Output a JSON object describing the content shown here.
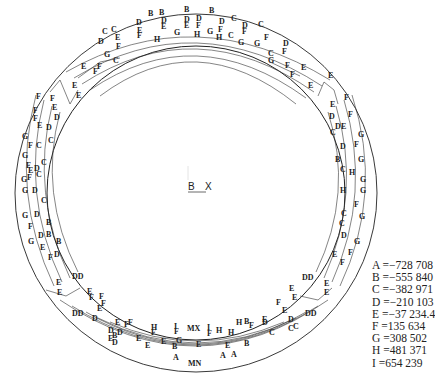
{
  "diagram": {
    "type": "contour-ring",
    "axis": {
      "x_label": "X",
      "origin_label": "B"
    },
    "legend": [
      {
        "key": "A",
        "value": "=−728 708"
      },
      {
        "key": "B",
        "value": "=−555 840"
      },
      {
        "key": "C",
        "value": "=−382 971"
      },
      {
        "key": "D",
        "value": "=−210 103"
      },
      {
        "key": "E",
        "value": "=−37 234.4"
      },
      {
        "key": "F",
        "value": "=135 634"
      },
      {
        "key": "G",
        "value": "=308 502"
      },
      {
        "key": "H",
        "value": "=481 371"
      },
      {
        "key": "I",
        "value": "=654 239"
      }
    ],
    "contour_labels": [
      {
        "t": "B",
        "x": 148,
        "y": 16
      },
      {
        "t": "B",
        "x": 159,
        "y": 15
      },
      {
        "t": "B",
        "x": 184,
        "y": 12
      },
      {
        "t": "B",
        "x": 209,
        "y": 13
      },
      {
        "t": "C",
        "x": 102,
        "y": 34
      },
      {
        "t": "C",
        "x": 111,
        "y": 32
      },
      {
        "t": "D",
        "x": 136,
        "y": 25
      },
      {
        "t": "D",
        "x": 161,
        "y": 23
      },
      {
        "t": "D",
        "x": 184,
        "y": 22
      },
      {
        "t": "D",
        "x": 196,
        "y": 21
      },
      {
        "t": "D",
        "x": 219,
        "y": 24
      },
      {
        "t": "C",
        "x": 231,
        "y": 21
      },
      {
        "t": "C",
        "x": 258,
        "y": 27
      },
      {
        "t": "D",
        "x": 242,
        "y": 28
      },
      {
        "t": "E",
        "x": 137,
        "y": 33
      },
      {
        "t": "E",
        "x": 161,
        "y": 29
      },
      {
        "t": "E",
        "x": 184,
        "y": 28
      },
      {
        "t": "F",
        "x": 196,
        "y": 28
      },
      {
        "t": "F",
        "x": 218,
        "y": 32
      },
      {
        "t": "F",
        "x": 242,
        "y": 34
      },
      {
        "t": "E",
        "x": 115,
        "y": 40
      },
      {
        "t": "F",
        "x": 137,
        "y": 38
      },
      {
        "t": "H",
        "x": 154,
        "y": 42
      },
      {
        "t": "G",
        "x": 174,
        "y": 35
      },
      {
        "t": "H",
        "x": 194,
        "y": 37
      },
      {
        "t": "G",
        "x": 207,
        "y": 34
      },
      {
        "t": "H",
        "x": 216,
        "y": 40
      },
      {
        "t": "C",
        "x": 228,
        "y": 38
      },
      {
        "t": "G",
        "x": 238,
        "y": 45
      },
      {
        "t": "G",
        "x": 254,
        "y": 46
      },
      {
        "t": "F",
        "x": 264,
        "y": 40
      },
      {
        "t": "D",
        "x": 98,
        "y": 44
      },
      {
        "t": "F",
        "x": 116,
        "y": 49
      },
      {
        "t": "G",
        "x": 104,
        "y": 57
      },
      {
        "t": "C",
        "x": 113,
        "y": 63
      },
      {
        "t": "C",
        "x": 268,
        "y": 56
      },
      {
        "t": "D",
        "x": 283,
        "y": 46
      },
      {
        "t": "F",
        "x": 282,
        "y": 54
      },
      {
        "t": "G",
        "x": 268,
        "y": 63
      },
      {
        "t": "F",
        "x": 285,
        "y": 68
      },
      {
        "t": "F",
        "x": 290,
        "y": 77
      },
      {
        "t": "E",
        "x": 301,
        "y": 70
      },
      {
        "t": "E",
        "x": 328,
        "y": 78
      },
      {
        "t": "E",
        "x": 308,
        "y": 88
      },
      {
        "t": "F",
        "x": 344,
        "y": 100
      },
      {
        "t": "E",
        "x": 330,
        "y": 107
      },
      {
        "t": "D",
        "x": 329,
        "y": 119
      },
      {
        "t": "F",
        "x": 348,
        "y": 117
      },
      {
        "t": "C",
        "x": 330,
        "y": 135
      },
      {
        "t": "D",
        "x": 335,
        "y": 129
      },
      {
        "t": "G",
        "x": 358,
        "y": 137
      },
      {
        "t": "E",
        "x": 341,
        "y": 129
      },
      {
        "t": "D",
        "x": 340,
        "y": 149
      },
      {
        "t": "F",
        "x": 354,
        "y": 147
      },
      {
        "t": "B",
        "x": 335,
        "y": 162
      },
      {
        "t": "G",
        "x": 358,
        "y": 162
      },
      {
        "t": "C",
        "x": 340,
        "y": 172
      },
      {
        "t": "H",
        "x": 349,
        "y": 175
      },
      {
        "t": "G",
        "x": 360,
        "y": 182
      },
      {
        "t": "H",
        "x": 340,
        "y": 193
      },
      {
        "t": "G",
        "x": 360,
        "y": 193
      },
      {
        "t": "F",
        "x": 354,
        "y": 207
      },
      {
        "t": "C",
        "x": 341,
        "y": 216
      },
      {
        "t": "G",
        "x": 359,
        "y": 219
      },
      {
        "t": "C",
        "x": 339,
        "y": 226
      },
      {
        "t": "D",
        "x": 341,
        "y": 238
      },
      {
        "t": "G",
        "x": 354,
        "y": 244
      },
      {
        "t": "F",
        "x": 348,
        "y": 255
      },
      {
        "t": "E",
        "x": 332,
        "y": 257
      },
      {
        "t": "F",
        "x": 340,
        "y": 265
      },
      {
        "t": "DD",
        "x": 302,
        "y": 280
      },
      {
        "t": "E",
        "x": 324,
        "y": 286
      },
      {
        "t": "E",
        "x": 324,
        "y": 295
      },
      {
        "t": "E",
        "x": 289,
        "y": 291
      },
      {
        "t": "E",
        "x": 292,
        "y": 300
      },
      {
        "t": "F",
        "x": 276,
        "y": 305
      },
      {
        "t": "E",
        "x": 282,
        "y": 313
      },
      {
        "t": "D",
        "x": 288,
        "y": 322
      },
      {
        "t": "DD",
        "x": 305,
        "y": 316
      },
      {
        "t": "C",
        "x": 288,
        "y": 331
      },
      {
        "t": "C",
        "x": 293,
        "y": 329
      },
      {
        "t": "D",
        "x": 262,
        "y": 325
      },
      {
        "t": "C",
        "x": 269,
        "y": 335
      },
      {
        "t": "H",
        "x": 236,
        "y": 325
      },
      {
        "t": "B",
        "x": 244,
        "y": 324
      },
      {
        "t": "F",
        "x": 249,
        "y": 328
      },
      {
        "t": "E",
        "x": 262,
        "y": 322
      },
      {
        "t": "H",
        "x": 228,
        "y": 335
      },
      {
        "t": "I",
        "x": 207,
        "y": 330
      },
      {
        "t": "F",
        "x": 207,
        "y": 336
      },
      {
        "t": "H",
        "x": 216,
        "y": 333
      },
      {
        "t": "MX",
        "x": 187,
        "y": 331
      },
      {
        "t": "F",
        "x": 174,
        "y": 334
      },
      {
        "t": "I",
        "x": 174,
        "y": 329
      },
      {
        "t": "H",
        "x": 151,
        "y": 330
      },
      {
        "t": "F",
        "x": 151,
        "y": 335
      },
      {
        "t": "F",
        "x": 124,
        "y": 327
      },
      {
        "t": "F",
        "x": 128,
        "y": 325
      },
      {
        "t": "E",
        "x": 115,
        "y": 325
      },
      {
        "t": "D",
        "x": 117,
        "y": 335
      },
      {
        "t": "D",
        "x": 108,
        "y": 333
      },
      {
        "t": "E",
        "x": 108,
        "y": 341
      },
      {
        "t": "D",
        "x": 112,
        "y": 345
      },
      {
        "t": "B",
        "x": 112,
        "y": 338
      },
      {
        "t": "E",
        "x": 136,
        "y": 341
      },
      {
        "t": "E",
        "x": 145,
        "y": 348
      },
      {
        "t": "E",
        "x": 161,
        "y": 344
      },
      {
        "t": "B",
        "x": 172,
        "y": 349
      },
      {
        "t": "G",
        "x": 176,
        "y": 343
      },
      {
        "t": "E",
        "x": 196,
        "y": 347
      },
      {
        "t": "E",
        "x": 225,
        "y": 348
      },
      {
        "t": "B",
        "x": 244,
        "y": 346
      },
      {
        "t": "A",
        "x": 220,
        "y": 358
      },
      {
        "t": "A",
        "x": 231,
        "y": 357
      },
      {
        "t": "A",
        "x": 173,
        "y": 360
      },
      {
        "t": "MN",
        "x": 188,
        "y": 366
      },
      {
        "t": "DD",
        "x": 72,
        "y": 316
      },
      {
        "t": "D",
        "x": 92,
        "y": 321
      },
      {
        "t": "E",
        "x": 56,
        "y": 285
      },
      {
        "t": "E",
        "x": 57,
        "y": 295
      },
      {
        "t": "E",
        "x": 87,
        "y": 294
      },
      {
        "t": "F",
        "x": 89,
        "y": 300
      },
      {
        "t": "F",
        "x": 99,
        "y": 299
      },
      {
        "t": "F",
        "x": 101,
        "y": 306
      },
      {
        "t": "E",
        "x": 97,
        "y": 311
      },
      {
        "t": "DD",
        "x": 72,
        "y": 279
      },
      {
        "t": "D",
        "x": 54,
        "y": 257
      },
      {
        "t": "F",
        "x": 48,
        "y": 260
      },
      {
        "t": "B",
        "x": 56,
        "y": 244
      },
      {
        "t": "G",
        "x": 28,
        "y": 244
      },
      {
        "t": "E",
        "x": 40,
        "y": 250
      },
      {
        "t": "B",
        "x": 46,
        "y": 237
      },
      {
        "t": "D",
        "x": 38,
        "y": 238
      },
      {
        "t": "B",
        "x": 46,
        "y": 225
      },
      {
        "t": "G",
        "x": 22,
        "y": 218
      },
      {
        "t": "D",
        "x": 34,
        "y": 217
      },
      {
        "t": "F",
        "x": 28,
        "y": 229
      },
      {
        "t": "C",
        "x": 41,
        "y": 203
      },
      {
        "t": "G",
        "x": 22,
        "y": 193
      },
      {
        "t": "D",
        "x": 32,
        "y": 193
      },
      {
        "t": "F",
        "x": 27,
        "y": 180
      },
      {
        "t": "C",
        "x": 36,
        "y": 177
      },
      {
        "t": "G",
        "x": 21,
        "y": 182
      },
      {
        "t": "D",
        "x": 34,
        "y": 171
      },
      {
        "t": "E",
        "x": 28,
        "y": 173
      },
      {
        "t": "F",
        "x": 26,
        "y": 168
      },
      {
        "t": "C",
        "x": 41,
        "y": 165
      },
      {
        "t": "G",
        "x": 22,
        "y": 158
      },
      {
        "t": "F",
        "x": 28,
        "y": 148
      },
      {
        "t": "C",
        "x": 36,
        "y": 148
      },
      {
        "t": "G",
        "x": 22,
        "y": 139
      },
      {
        "t": "C",
        "x": 48,
        "y": 143
      },
      {
        "t": "E",
        "x": 37,
        "y": 128
      },
      {
        "t": "D",
        "x": 46,
        "y": 130
      },
      {
        "t": "F",
        "x": 33,
        "y": 121
      },
      {
        "t": "D",
        "x": 54,
        "y": 120
      },
      {
        "t": "F",
        "x": 33,
        "y": 113
      },
      {
        "t": "F",
        "x": 36,
        "y": 99
      },
      {
        "t": "F",
        "x": 50,
        "y": 101
      },
      {
        "t": "E",
        "x": 52,
        "y": 110
      },
      {
        "t": "E",
        "x": 72,
        "y": 88
      },
      {
        "t": "E",
        "x": 81,
        "y": 69
      },
      {
        "t": "F",
        "x": 93,
        "y": 74
      },
      {
        "t": "F",
        "x": 97,
        "y": 69
      },
      {
        "t": "E",
        "x": 76,
        "y": 98
      }
    ]
  }
}
